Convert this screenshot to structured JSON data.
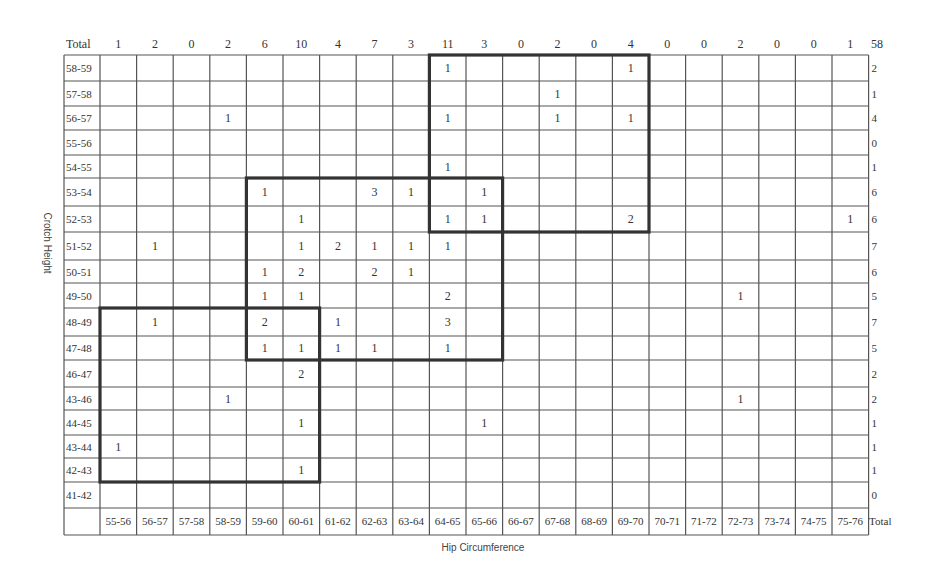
{
  "chart_data": {
    "type": "heatmap",
    "title": "",
    "xlabel": "Hip Circumference",
    "ylabel": "Crotch Height",
    "x_categories": [
      "55-56",
      "56-57",
      "57-58",
      "58-59",
      "59-60",
      "60-61",
      "61-62",
      "62-63",
      "63-64",
      "64-65",
      "65-66",
      "66-67",
      "67-68",
      "68-69",
      "69-70",
      "70-71",
      "71-72",
      "72-73",
      "73-74",
      "74-75",
      "75-76"
    ],
    "y_categories": [
      "58-59",
      "57-58",
      "56-57",
      "55-56",
      "54-55",
      "53-54",
      "52-53",
      "51-52",
      "50-51",
      "49-50",
      "48-49",
      "47-48",
      "46-47",
      "45-46",
      "44-45",
      "43-44",
      "42-43",
      "41-42"
    ],
    "y_categories_displayed": [
      "58-59",
      "57-58",
      "56-57",
      "55-56",
      "54-55",
      "53-54",
      "52-53",
      "51-52",
      "50-51",
      "49-50",
      "48-49",
      "47-48",
      "46-47",
      "43-46",
      "44-45",
      "43-44",
      "42-43",
      "41-42"
    ],
    "cells": [
      [
        0,
        0,
        0,
        0,
        0,
        0,
        0,
        0,
        0,
        1,
        0,
        0,
        0,
        0,
        1,
        0,
        0,
        0,
        0,
        0,
        0
      ],
      [
        0,
        0,
        0,
        0,
        0,
        0,
        0,
        0,
        0,
        0,
        0,
        0,
        1,
        0,
        0,
        0,
        0,
        0,
        0,
        0,
        0
      ],
      [
        0,
        0,
        0,
        1,
        0,
        0,
        0,
        0,
        0,
        1,
        0,
        0,
        1,
        0,
        1,
        0,
        0,
        0,
        0,
        0,
        0
      ],
      [
        0,
        0,
        0,
        0,
        0,
        0,
        0,
        0,
        0,
        0,
        0,
        0,
        0,
        0,
        0,
        0,
        0,
        0,
        0,
        0,
        0
      ],
      [
        0,
        0,
        0,
        0,
        0,
        0,
        0,
        0,
        0,
        1,
        0,
        0,
        0,
        0,
        0,
        0,
        0,
        0,
        0,
        0,
        0
      ],
      [
        0,
        0,
        0,
        0,
        1,
        0,
        0,
        3,
        1,
        0,
        1,
        0,
        0,
        0,
        0,
        0,
        0,
        0,
        0,
        0,
        0
      ],
      [
        0,
        0,
        0,
        0,
        0,
        1,
        0,
        0,
        0,
        1,
        1,
        0,
        0,
        0,
        2,
        0,
        0,
        0,
        0,
        0,
        1
      ],
      [
        0,
        1,
        0,
        0,
        0,
        1,
        2,
        1,
        1,
        1,
        0,
        0,
        0,
        0,
        0,
        0,
        0,
        0,
        0,
        0,
        0
      ],
      [
        0,
        0,
        0,
        0,
        1,
        2,
        0,
        2,
        1,
        0,
        0,
        0,
        0,
        0,
        0,
        0,
        0,
        0,
        0,
        0,
        0
      ],
      [
        0,
        0,
        0,
        0,
        1,
        1,
        0,
        0,
        0,
        2,
        0,
        0,
        0,
        0,
        0,
        0,
        0,
        1,
        0,
        0,
        0
      ],
      [
        0,
        1,
        0,
        0,
        2,
        0,
        1,
        0,
        0,
        3,
        0,
        0,
        0,
        0,
        0,
        0,
        0,
        0,
        0,
        0,
        0
      ],
      [
        0,
        0,
        0,
        0,
        1,
        1,
        1,
        1,
        0,
        1,
        0,
        0,
        0,
        0,
        0,
        0,
        0,
        0,
        0,
        0,
        0
      ],
      [
        0,
        0,
        0,
        0,
        0,
        2,
        0,
        0,
        0,
        0,
        0,
        0,
        0,
        0,
        0,
        0,
        0,
        0,
        0,
        0,
        0
      ],
      [
        0,
        0,
        0,
        1,
        0,
        0,
        0,
        0,
        0,
        0,
        0,
        0,
        0,
        0,
        0,
        0,
        0,
        1,
        0,
        0,
        0
      ],
      [
        0,
        0,
        0,
        0,
        0,
        1,
        0,
        0,
        0,
        0,
        1,
        0,
        0,
        0,
        0,
        0,
        0,
        0,
        0,
        0,
        0
      ],
      [
        1,
        0,
        0,
        0,
        0,
        0,
        0,
        0,
        0,
        0,
        0,
        0,
        0,
        0,
        0,
        0,
        0,
        0,
        0,
        0,
        0
      ],
      [
        0,
        0,
        0,
        0,
        0,
        1,
        0,
        0,
        0,
        0,
        0,
        0,
        0,
        0,
        0,
        0,
        0,
        0,
        0,
        0,
        0
      ],
      [
        0,
        0,
        0,
        0,
        0,
        0,
        0,
        0,
        0,
        0,
        0,
        0,
        0,
        0,
        0,
        0,
        0,
        0,
        0,
        0,
        0
      ]
    ],
    "column_totals": [
      1,
      2,
      0,
      2,
      6,
      10,
      4,
      7,
      3,
      11,
      3,
      0,
      2,
      0,
      4,
      0,
      0,
      2,
      0,
      0,
      1
    ],
    "row_totals": [
      2,
      1,
      4,
      0,
      1,
      6,
      6,
      7,
      6,
      5,
      7,
      5,
      2,
      2,
      1,
      1,
      1,
      0
    ],
    "grand_total": 58,
    "header_total_label": "Total",
    "footer_total_label": "Total",
    "highlight_boxes": [
      {
        "name": "size-group-large",
        "col_start": 9,
        "col_end": 15,
        "row_start": 0,
        "row_end": 7
      },
      {
        "name": "size-group-medium",
        "col_start": 4,
        "col_end": 11,
        "row_start": 5,
        "row_end": 12
      },
      {
        "name": "size-group-small",
        "col_start": 0,
        "col_end": 6,
        "row_start": 10,
        "row_end": 17
      }
    ],
    "grid": true,
    "legend": "none"
  }
}
